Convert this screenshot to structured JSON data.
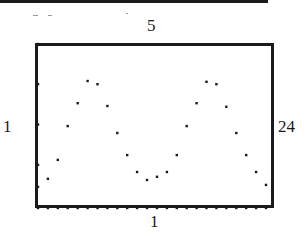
{
  "figure": {
    "labels": {
      "ymax": "5",
      "ymin": "1",
      "xmin": "1",
      "xmax": "24"
    }
  },
  "chart_data": {
    "type": "scatter",
    "title": "",
    "xlabel": "",
    "ylabel": "",
    "xlim": [
      1,
      24
    ],
    "ylim": [
      1,
      5
    ],
    "grid": false,
    "legend": null,
    "window_labels": {
      "top": "5",
      "bottom": "1",
      "left": "1",
      "right": "24"
    },
    "x_axis_ticks_dotted": true,
    "series": [
      {
        "name": "data",
        "x": [
          1,
          2,
          3,
          4,
          5,
          6,
          7,
          8,
          9,
          10,
          11,
          12,
          13,
          14,
          15,
          16,
          17,
          18,
          19,
          20,
          21,
          22,
          23,
          24
        ],
        "y": [
          1.45,
          1.65,
          2.12,
          2.96,
          3.53,
          4.08,
          4.0,
          3.46,
          2.79,
          2.24,
          1.82,
          1.62,
          1.7,
          1.82,
          2.24,
          2.96,
          3.53,
          4.06,
          4.0,
          3.44,
          2.79,
          2.24,
          1.82,
          1.5
        ]
      }
    ]
  },
  "colors": {
    "ink": "#1a1a1a",
    "background": "#ffffff"
  }
}
